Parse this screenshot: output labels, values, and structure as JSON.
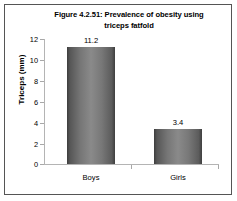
{
  "chart_data": {
    "type": "bar",
    "title": "Figure 4.2.51: Prevalence of obesity using triceps fatfold",
    "title_line1": "Figure 4.2.51: Prevalence of obesity using",
    "title_line2": "triceps fatfold",
    "categories": [
      "Boys",
      "Girls"
    ],
    "values": [
      11.2,
      3.4
    ],
    "data_labels": [
      "11.2",
      "3.4"
    ],
    "xlabel": "",
    "ylabel": "Triceps (mm)",
    "ylim": [
      0,
      12
    ],
    "ytick_labels": [
      "12",
      "10",
      "8",
      "6",
      "4",
      "2",
      "0"
    ],
    "ytick_values": [
      12,
      10,
      8,
      6,
      4,
      2,
      0
    ],
    "grid": false,
    "legend": false,
    "bar_color": "#7a7a7a",
    "axis_color": "#b4b4b4",
    "border_color": "#555555",
    "background": "#ffffff"
  }
}
